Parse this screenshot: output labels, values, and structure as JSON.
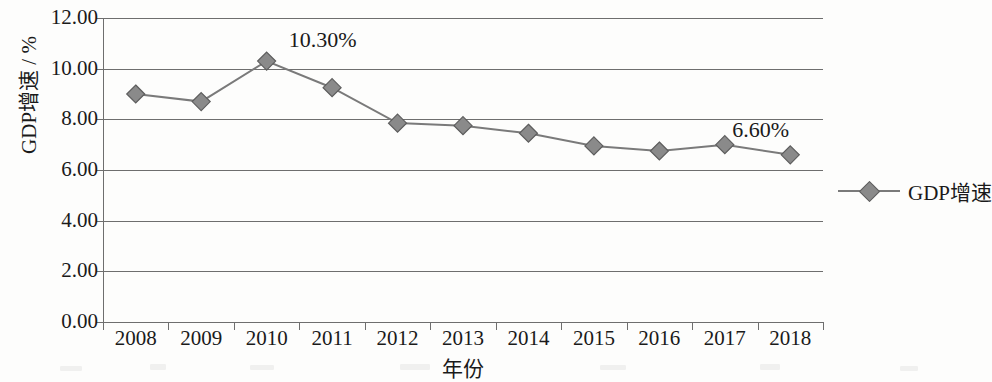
{
  "chart_data": {
    "type": "line",
    "title": "",
    "xlabel": "年份",
    "ylabel": "GDP增速 / %",
    "categories": [
      "2008",
      "2009",
      "2010",
      "2011",
      "2012",
      "2013",
      "2014",
      "2015",
      "2016",
      "2017",
      "2018"
    ],
    "series": [
      {
        "name": "GDP增速",
        "values": [
          9.0,
          8.7,
          10.3,
          9.25,
          7.85,
          7.75,
          7.45,
          6.95,
          6.75,
          7.0,
          6.6
        ]
      }
    ],
    "ylim": [
      0,
      12
    ],
    "ytick_labels": [
      "12.00",
      "10.00",
      "8.00",
      "6.00",
      "4.00",
      "2.00",
      "0.00"
    ],
    "ytick_values": [
      12,
      10,
      8,
      6,
      4,
      2,
      0
    ],
    "grid": "horizontal",
    "legend_position": "right",
    "marker": "diamond",
    "annotations": [
      {
        "text": "10.30%",
        "category": "2010",
        "value": 10.3
      },
      {
        "text": "6.60%",
        "category": "2018",
        "value": 6.6
      }
    ],
    "colors": {
      "line": "#7a7a7a",
      "marker": "#8a8a8a",
      "marker_edge": "#5d5d5d",
      "axis": "#6e6e6e",
      "text": "#1a1a1a",
      "background": "#fdfdfc"
    }
  },
  "legend": {
    "entries": [
      {
        "label": "GDP增速"
      }
    ]
  }
}
